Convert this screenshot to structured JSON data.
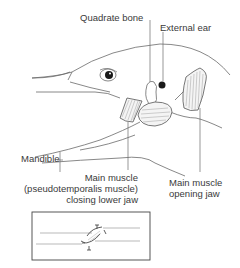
{
  "diagram": {
    "labels": {
      "quadrate_bone": "Quadrate bone",
      "external_ear": "External ear",
      "mandible": "Mandible",
      "closing_muscle_line1": "Main muscle",
      "closing_muscle_line2": "(pseudotemporalis muscle)",
      "closing_muscle_line3": "closing lower jaw",
      "opening_muscle_line1": "Main muscle",
      "opening_muscle_line2": "opening jaw"
    },
    "inset": {
      "description": "Schematic of muscle between two jaw lines"
    },
    "colors": {
      "line": "#6a6a6a",
      "text": "#3a3a3a",
      "eye": "#1a1a1a",
      "background": "#ffffff"
    }
  }
}
